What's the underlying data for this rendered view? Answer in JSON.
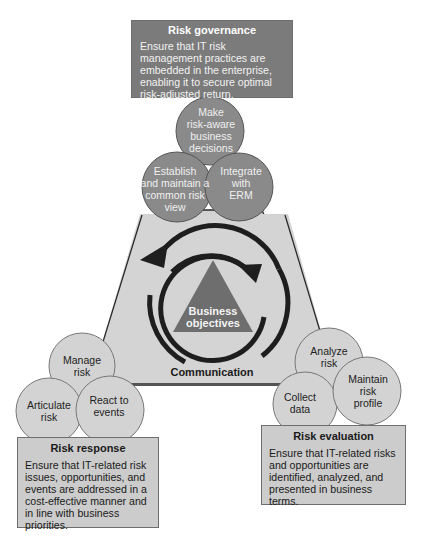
{
  "governance": {
    "title": "Risk governance",
    "body": "Ensure that IT risk management practices are embedded in the enterprise, enabling it to secure optimal risk-adjusted return.",
    "circles": [
      {
        "label_lines": [
          "Make",
          "risk-aware",
          "business",
          "decisions"
        ]
      },
      {
        "label_lines": [
          "Establish",
          "and maintain a",
          "common risk",
          "view"
        ]
      },
      {
        "label_lines": [
          "Integrate",
          "with",
          "ERM"
        ]
      }
    ],
    "color": "#7b7b7b"
  },
  "response": {
    "title": "Risk response",
    "body": "Ensure that IT-related risk issues, opportunities, and events are addressed in a cost-effective manner and in line with business priorities.",
    "circles": [
      {
        "label_lines": [
          "Manage",
          "risk"
        ]
      },
      {
        "label_lines": [
          "Articulate",
          "risk"
        ]
      },
      {
        "label_lines": [
          "React to",
          "events"
        ]
      }
    ],
    "color": "#cccccc"
  },
  "evaluation": {
    "title": "Risk evaluation",
    "body": "Ensure that IT-related risks and opportunities are identified, analyzed, and presented in business terms.",
    "circles": [
      {
        "label_lines": [
          "Analyze",
          "risk"
        ]
      },
      {
        "label_lines": [
          "Collect",
          "data"
        ]
      },
      {
        "label_lines": [
          "Maintain",
          "risk",
          "profile"
        ]
      }
    ],
    "color": "#cccccc"
  },
  "center": {
    "label_lines": [
      "Business",
      "objectives"
    ],
    "color": "#6e6e6e"
  },
  "communication": {
    "label": "Communication"
  },
  "colors": {
    "triangle_fill": "#d2d2d2",
    "triangle_stroke": "#2a2a2a",
    "arrow": "#1e1e1e"
  }
}
